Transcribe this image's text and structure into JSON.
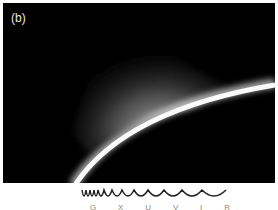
{
  "figure": {
    "panel_label": "(b)",
    "spectrum_ticks": [
      "G",
      "X",
      "U",
      "V",
      "I",
      "R"
    ]
  }
}
